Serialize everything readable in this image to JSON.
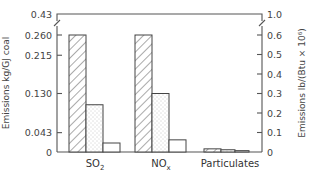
{
  "chart_data": {
    "type": "bar",
    "title": "",
    "xlabel": "",
    "ylabel": "Emissions kg/GJ coal",
    "ylabel_right": "Emissions lb/(Btu × 10⁶)",
    "categories": [
      "SO2",
      "NOx",
      "Particulates"
    ],
    "category_labels": [
      {
        "base": "SO",
        "sub": "2"
      },
      {
        "base": "NO",
        "sub": "x"
      },
      {
        "base": "Particulates",
        "sub": ""
      }
    ],
    "series": [
      {
        "name": "hatched",
        "pattern": "hatch",
        "values": [
          0.26,
          0.26,
          0.007
        ]
      },
      {
        "name": "dotted",
        "pattern": "dots",
        "values": [
          0.105,
          0.13,
          0.005
        ]
      },
      {
        "name": "plain",
        "pattern": "none",
        "values": [
          0.02,
          0.027,
          0.003
        ]
      }
    ],
    "left_axis": {
      "ticks": [
        "0",
        "0.043",
        "0.130",
        "0.215",
        "0.260",
        "0.43"
      ],
      "tick_values": [
        0,
        0.043,
        0.13,
        0.215,
        0.26,
        0.43
      ],
      "axis_break": true
    },
    "right_axis": {
      "ticks": [
        "0",
        "0.1",
        "0.2",
        "0.3",
        "0.4",
        "0.5",
        "0.6",
        "1.0"
      ],
      "tick_values": [
        0,
        0.1,
        0.2,
        0.3,
        0.4,
        0.5,
        0.6,
        1.0
      ],
      "axis_break": true
    },
    "ylim": [
      0,
      0.43
    ],
    "grid": false,
    "legend": "none"
  }
}
